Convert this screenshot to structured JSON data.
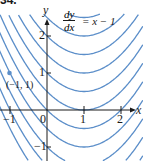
{
  "figure": {
    "number_label": "34.",
    "equation": {
      "numerator": "dy",
      "denominator": "dx",
      "rhs": "= x − 1"
    },
    "axis_labels": {
      "x": "x",
      "y": "y"
    },
    "point_label": "(−1, 1)"
  },
  "colors": {
    "curve": "#5b8ec9",
    "point": "#5b8ec9",
    "axis": "#1a1a1a"
  },
  "chart_data": {
    "type": "line",
    "xlabel": "x",
    "ylabel": "y",
    "xlim": [
      -1.25,
      2.6
    ],
    "ylim": [
      -1.35,
      2.8
    ],
    "grid": false,
    "x_ticks": [
      {
        "value": -1,
        "label": "−1"
      },
      {
        "value": 0,
        "label": "0"
      },
      {
        "value": 1,
        "label": "1"
      },
      {
        "value": 2,
        "label": "2"
      }
    ],
    "y_ticks": [
      {
        "value": -1,
        "label": "−1"
      },
      {
        "value": 1,
        "label": "1"
      },
      {
        "value": 2,
        "label": "2"
      }
    ],
    "solution_family": "y = x^2/2 − x + C",
    "series": [
      {
        "name": "C=-0.5",
        "C": -0.5
      },
      {
        "name": "C=0",
        "C": 0
      },
      {
        "name": "C=0.5",
        "C": 0.5
      },
      {
        "name": "C=1",
        "C": 1
      },
      {
        "name": "C=1.5",
        "C": 1.5
      },
      {
        "name": "C=2",
        "C": 2
      },
      {
        "name": "C=2.5",
        "C": 2.5
      },
      {
        "name": "C=3",
        "C": 3
      },
      {
        "name": "C=-1",
        "C": -1
      },
      {
        "name": "C=-1.5",
        "C": -1.5
      },
      {
        "name": "C=-2",
        "C": -2
      }
    ],
    "highlighted_point": {
      "x": -1,
      "y": 1,
      "label": "(−1, 1)"
    }
  }
}
